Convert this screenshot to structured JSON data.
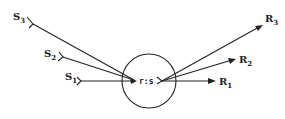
{
  "diagram": {
    "center_label": "r:s",
    "sources": [
      {
        "id": "S1",
        "main": "S",
        "sub": "1"
      },
      {
        "id": "S2",
        "main": "S",
        "sub": "2"
      },
      {
        "id": "S3",
        "main": "S",
        "sub": "3"
      }
    ],
    "receivers": [
      {
        "id": "R1",
        "main": "R",
        "sub": "1"
      },
      {
        "id": "R2",
        "main": "R",
        "sub": "2"
      },
      {
        "id": "R3",
        "main": "R",
        "sub": "3"
      }
    ],
    "colors": {
      "stroke": "#222222",
      "background": "#ffffff"
    }
  }
}
